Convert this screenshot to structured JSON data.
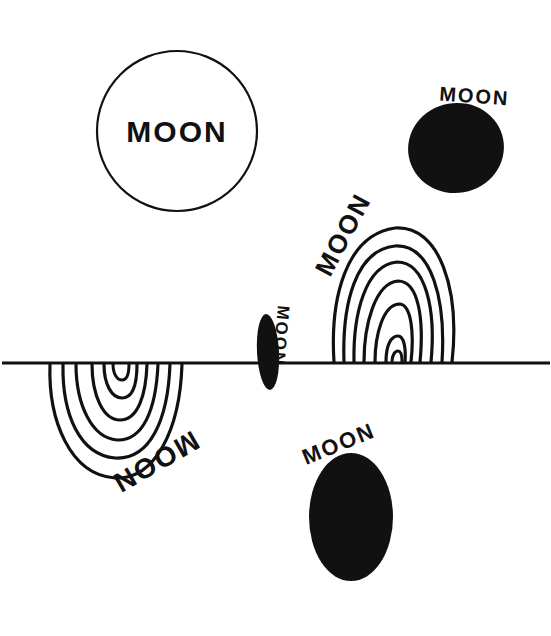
{
  "illustration": {
    "background": "#ffffff",
    "ink_color": "#111111",
    "horizon": {
      "y": 363,
      "x1": 2,
      "x2": 550
    },
    "moons": [
      {
        "id": "outline-full-moon",
        "style": "outline circle",
        "label": "MOON"
      },
      {
        "id": "solid-dark-moon",
        "style": "filled circle",
        "label": "MOON"
      },
      {
        "id": "rising-rainbow-moon",
        "style": "concentric arches above horizon",
        "label": "MOON"
      },
      {
        "id": "thin-sliver-moon",
        "style": "filled narrow oval crossing horizon",
        "label": "MOON"
      },
      {
        "id": "reflected-rainbow-moon",
        "style": "concentric arches below horizon, upside-down",
        "label": "MOON"
      },
      {
        "id": "low-dark-oval-moon",
        "style": "filled tall oval",
        "label": "MOON"
      }
    ]
  }
}
